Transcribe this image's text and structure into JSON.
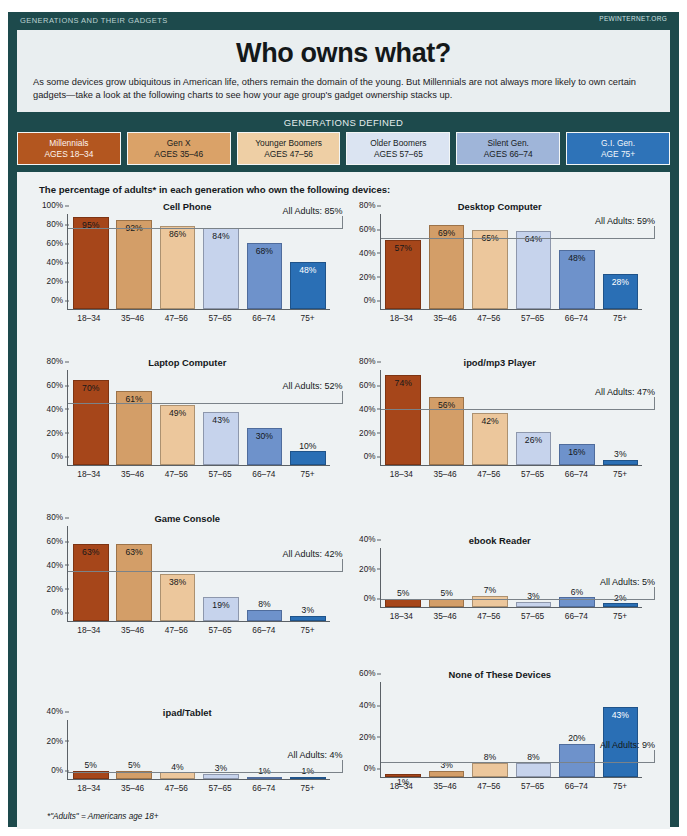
{
  "header": {
    "kicker": "GENERATIONS AND THEIR GADGETS",
    "source": "PEWINTERNET.ORG"
  },
  "title": {
    "main": "Who owns what?",
    "deck": "As some devices grow ubiquitous in American life, others remain the domain of the young. But Millennials are not always more likely to own certain gadgets—take a look at the following charts to see how your age group's gadget ownership stacks up."
  },
  "generations": {
    "band_title": "GENERATIONS DEFINED",
    "chips": [
      {
        "name": "Millennials",
        "ages": "AGES 18–34",
        "color": "#b3561f"
      },
      {
        "name": "Gen X",
        "ages": "AGES 35–46",
        "color": "#daa268"
      },
      {
        "name": "Younger Boomers",
        "ages": "AGES 47–56",
        "color": "#eecfa5"
      },
      {
        "name": "Older Boomers",
        "ages": "AGES 57–65",
        "color": "#dbe4f2"
      },
      {
        "name": "Silent Gen.",
        "ages": "AGES 66–74",
        "color": "#9fb5d9"
      },
      {
        "name": "G.I. Gen.",
        "ages": "AGE 75+",
        "color": "#2e73b8"
      }
    ]
  },
  "panel": {
    "lead": "The percentage of adults* in each generation who own the following devices:",
    "footnote": "*\"Adults\" = Americans age 18+"
  },
  "chart_data": [
    {
      "type": "bar",
      "title": "Cell Phone",
      "categories": [
        "18–34",
        "35–46",
        "47–56",
        "57–65",
        "66–74",
        "75+"
      ],
      "values": [
        95,
        92,
        86,
        84,
        68,
        48
      ],
      "labels": [
        "95%",
        "92%",
        "86%",
        "84%",
        "68%",
        "48%"
      ],
      "label_pos": [
        "inside",
        "inside",
        "inside",
        "inside",
        "inside",
        "inside"
      ],
      "label_color": [
        "dark",
        "dark",
        "dark",
        "dark",
        "dark",
        "light"
      ],
      "ylim": [
        0,
        100
      ],
      "yticks": [
        0,
        20,
        40,
        60,
        80,
        100
      ],
      "ytick_labels": [
        "0%",
        "20%",
        "40%",
        "60%",
        "80%",
        "100%"
      ],
      "reference": {
        "value": 85,
        "label": "All Adults: 85%"
      },
      "xlabel": "",
      "ylabel": ""
    },
    {
      "type": "bar",
      "title": "Desktop Computer",
      "categories": [
        "18–34",
        "35–46",
        "47–56",
        "57–65",
        "66–74",
        "75+"
      ],
      "values": [
        57,
        69,
        65,
        64,
        48,
        28
      ],
      "labels": [
        "57%",
        "69%",
        "65%",
        "64%",
        "48%",
        "28%"
      ],
      "label_pos": [
        "inside",
        "inside",
        "inside",
        "inside",
        "inside",
        "inside"
      ],
      "label_color": [
        "dark",
        "dark",
        "dark",
        "dark",
        "dark",
        "light"
      ],
      "ylim": [
        0,
        80
      ],
      "yticks": [
        0,
        20,
        40,
        60,
        80
      ],
      "ytick_labels": [
        "0%",
        "20%",
        "40%",
        "60%",
        "80%"
      ],
      "reference": {
        "value": 59,
        "label": "All Adults: 59%"
      },
      "xlabel": "",
      "ylabel": ""
    },
    {
      "type": "bar",
      "title": "Laptop Computer",
      "categories": [
        "18–34",
        "35–46",
        "47–56",
        "57–65",
        "66–74",
        "75+"
      ],
      "values": [
        70,
        61,
        49,
        43,
        30,
        10
      ],
      "labels": [
        "70%",
        "61%",
        "49%",
        "43%",
        "30%",
        "10%"
      ],
      "label_pos": [
        "inside",
        "inside",
        "inside",
        "inside",
        "inside",
        "above"
      ],
      "label_color": [
        "dark",
        "dark",
        "dark",
        "dark",
        "dark",
        "dark"
      ],
      "ylim": [
        0,
        80
      ],
      "yticks": [
        0,
        20,
        40,
        60,
        80
      ],
      "ytick_labels": [
        "0%",
        "20%",
        "40%",
        "60%",
        "80%"
      ],
      "reference": {
        "value": 52,
        "label": "All Adults: 52%"
      },
      "xlabel": "",
      "ylabel": ""
    },
    {
      "type": "bar",
      "title": "ipod/mp3 Player",
      "categories": [
        "18–34",
        "35–46",
        "47–56",
        "57–65",
        "66–74",
        "75+"
      ],
      "values": [
        74,
        56,
        42,
        26,
        16,
        3
      ],
      "labels": [
        "74%",
        "56%",
        "42%",
        "26%",
        "16%",
        "3%"
      ],
      "label_pos": [
        "inside",
        "inside",
        "inside",
        "inside",
        "inside",
        "above"
      ],
      "label_color": [
        "dark",
        "dark",
        "dark",
        "dark",
        "dark",
        "dark"
      ],
      "ylim": [
        0,
        80
      ],
      "yticks": [
        0,
        20,
        40,
        60,
        80
      ],
      "ytick_labels": [
        "0%",
        "20%",
        "40%",
        "60%",
        "80%"
      ],
      "reference": {
        "value": 47,
        "label": "All Adults: 47%"
      },
      "xlabel": "",
      "ylabel": ""
    },
    {
      "type": "bar",
      "title": "Game Console",
      "categories": [
        "18–34",
        "35–46",
        "47–56",
        "57–65",
        "66–74",
        "75+"
      ],
      "values": [
        63,
        63,
        38,
        19,
        8,
        3
      ],
      "labels": [
        "63%",
        "63%",
        "38%",
        "19%",
        "8%",
        "3%"
      ],
      "label_pos": [
        "inside",
        "inside",
        "inside",
        "inside",
        "above",
        "above"
      ],
      "label_color": [
        "dark",
        "dark",
        "dark",
        "dark",
        "dark",
        "dark"
      ],
      "ylim": [
        0,
        80
      ],
      "yticks": [
        0,
        20,
        40,
        60,
        80
      ],
      "ytick_labels": [
        "0%",
        "20%",
        "40%",
        "60%",
        "80%"
      ],
      "reference": {
        "value": 42,
        "label": "All Adults: 42%"
      },
      "xlabel": "",
      "ylabel": ""
    },
    {
      "type": "bar",
      "title": "ebook Reader",
      "categories": [
        "18–34",
        "35–46",
        "47–56",
        "57–65",
        "66–74",
        "75+"
      ],
      "values": [
        5,
        5,
        7,
        3,
        6,
        2
      ],
      "labels": [
        "5%",
        "5%",
        "7%",
        "3%",
        "6%",
        "2%"
      ],
      "label_pos": [
        "above",
        "above",
        "above",
        "above",
        "above",
        "above"
      ],
      "label_color": [
        "dark",
        "dark",
        "dark",
        "dark",
        "dark",
        "dark"
      ],
      "ylim": [
        0,
        40
      ],
      "yticks": [
        0,
        20,
        40
      ],
      "ytick_labels": [
        "0%",
        "20%",
        "40%"
      ],
      "reference": {
        "value": 5,
        "label": "All Adults: 5%"
      },
      "xlabel": "",
      "ylabel": ""
    },
    {
      "type": "bar",
      "title": "ipad/Tablet",
      "categories": [
        "18–34",
        "35–46",
        "47–56",
        "57–65",
        "66–74",
        "75+"
      ],
      "values": [
        5,
        5,
        4,
        3,
        1,
        1
      ],
      "labels": [
        "5%",
        "5%",
        "4%",
        "3%",
        "1%",
        "1%"
      ],
      "label_pos": [
        "above",
        "above",
        "above",
        "above",
        "above",
        "above"
      ],
      "label_color": [
        "dark",
        "dark",
        "dark",
        "dark",
        "dark",
        "dark"
      ],
      "ylim": [
        0,
        40
      ],
      "yticks": [
        0,
        20,
        40
      ],
      "ytick_labels": [
        "0%",
        "20%",
        "40%"
      ],
      "reference": {
        "value": 4,
        "label": "All Adults: 4%"
      },
      "xlabel": "",
      "ylabel": ""
    },
    {
      "type": "bar",
      "title": "None of These Devices",
      "categories": [
        "18–34",
        "35–46",
        "47–56",
        "57–65",
        "66–74",
        "75+"
      ],
      "values": [
        1,
        3,
        8,
        8,
        20,
        43
      ],
      "labels": [
        "1%",
        "3%",
        "8%",
        "8%",
        "20%",
        "43%"
      ],
      "label_pos": [
        "inside",
        "above",
        "above",
        "above",
        "above",
        "inside"
      ],
      "label_color": [
        "dark",
        "dark",
        "dark",
        "dark",
        "dark",
        "light"
      ],
      "ylim": [
        0,
        60
      ],
      "yticks": [
        0,
        20,
        40,
        60
      ],
      "ytick_labels": [
        "0%",
        "20%",
        "40%",
        "60%"
      ],
      "reference": {
        "value": 9,
        "label": "All Adults: 9%"
      },
      "xlabel": "",
      "ylabel": ""
    }
  ]
}
